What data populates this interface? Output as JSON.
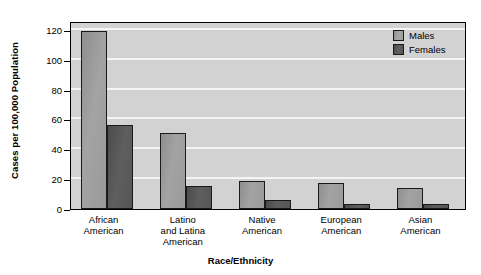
{
  "chart_data": {
    "type": "bar",
    "title": "",
    "xlabel": "Race/Ethnicity",
    "ylabel": "Cases per 100,000 Population",
    "categories": [
      "African\nAmerican",
      "Latino\nand Latina\nAmerican",
      "Native\nAmerican",
      "European\nAmerican",
      "Asian\nAmerican"
    ],
    "category_lines": [
      [
        "African",
        "American"
      ],
      [
        "Latino",
        "and Latina",
        "American"
      ],
      [
        "Native",
        "American"
      ],
      [
        "European",
        "American"
      ],
      [
        "Asian",
        "American"
      ]
    ],
    "series": [
      {
        "name": "Males",
        "values": [
          119,
          51,
          18.5,
          17.5,
          14
        ],
        "color": "#a0a0a0"
      },
      {
        "name": "Females",
        "values": [
          56.5,
          15.5,
          6,
          3.5,
          3.5
        ],
        "color": "#555555"
      }
    ],
    "ylim": [
      0,
      126
    ],
    "yticks": [
      0,
      20,
      40,
      60,
      80,
      100,
      120
    ],
    "ytick_labels": [
      "0",
      "20",
      "40",
      "60",
      "80",
      "100",
      "120"
    ],
    "grid": true,
    "grid_axis": "y",
    "legend_position": "top-right",
    "plot_background": "#d2d2d2",
    "gridline_color": "#f4f4f4"
  },
  "legend": {
    "entries": [
      {
        "label": "Males"
      },
      {
        "label": "Females"
      }
    ]
  },
  "axes": {
    "y_title": "Cases per 100,000 Population",
    "x_title": "Race/Ethnicity"
  }
}
